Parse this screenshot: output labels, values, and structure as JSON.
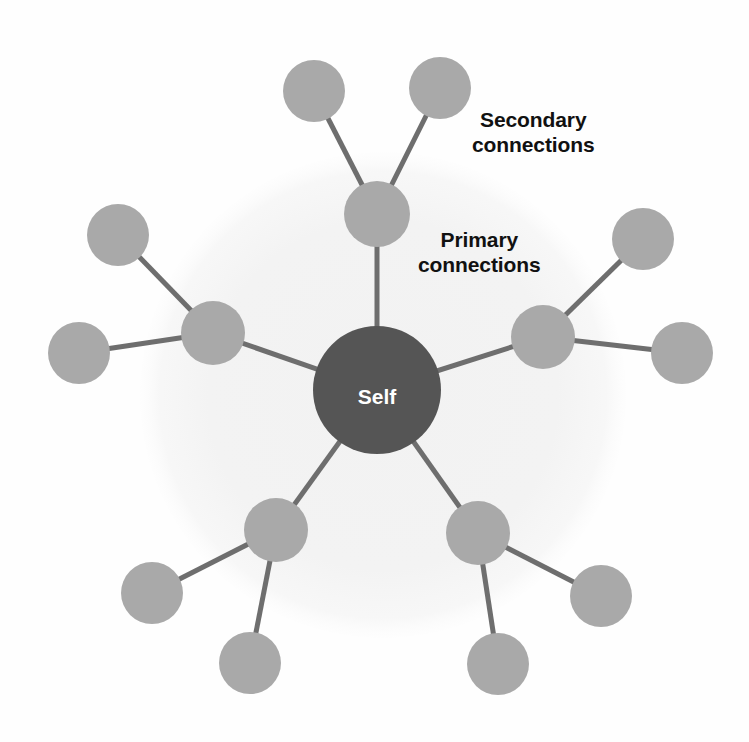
{
  "diagram": {
    "background_color": "#fefefe",
    "halo": {
      "name": "primary-connections-halo",
      "cx": 383,
      "cy": 395,
      "r": 243,
      "color": "#f4f4f4"
    },
    "colors": {
      "self_node": "#555555",
      "connection_node": "#a9a9a9",
      "edge": "#6e6e6e",
      "self_label": "#ffffff",
      "annotation_text": "#111111"
    },
    "center_node": {
      "id": "self",
      "label": "Self",
      "cx": 377,
      "cy": 390,
      "r": 64,
      "fill": "#555555"
    },
    "primary_nodes": [
      {
        "id": "primary-top",
        "cx": 377,
        "cy": 214,
        "r": 33
      },
      {
        "id": "primary-left",
        "cx": 213,
        "cy": 333,
        "r": 32
      },
      {
        "id": "primary-right",
        "cx": 543,
        "cy": 337,
        "r": 32
      },
      {
        "id": "primary-bottom-left",
        "cx": 276,
        "cy": 530,
        "r": 32
      },
      {
        "id": "primary-bottom-right",
        "cx": 478,
        "cy": 533,
        "r": 32
      }
    ],
    "secondary_nodes": [
      {
        "id": "secondary-top-left",
        "cx": 314,
        "cy": 91,
        "r": 31,
        "parent": "primary-top"
      },
      {
        "id": "secondary-top-right",
        "cx": 440,
        "cy": 88,
        "r": 31,
        "parent": "primary-top"
      },
      {
        "id": "secondary-left-upper",
        "cx": 118,
        "cy": 235,
        "r": 31,
        "parent": "primary-left"
      },
      {
        "id": "secondary-left-lower",
        "cx": 79,
        "cy": 353,
        "r": 31,
        "parent": "primary-left"
      },
      {
        "id": "secondary-right-upper",
        "cx": 643,
        "cy": 239,
        "r": 31,
        "parent": "primary-right"
      },
      {
        "id": "secondary-right-lower",
        "cx": 682,
        "cy": 353,
        "r": 31,
        "parent": "primary-right"
      },
      {
        "id": "secondary-bottom-left-outer",
        "cx": 152,
        "cy": 593,
        "r": 31,
        "parent": "primary-bottom-left"
      },
      {
        "id": "secondary-bottom-left-lower",
        "cx": 250,
        "cy": 663,
        "r": 31,
        "parent": "primary-bottom-left"
      },
      {
        "id": "secondary-bottom-right-outer",
        "cx": 601,
        "cy": 596,
        "r": 31,
        "parent": "primary-bottom-right"
      },
      {
        "id": "secondary-bottom-right-lower",
        "cx": 498,
        "cy": 664,
        "r": 31,
        "parent": "primary-bottom-right"
      }
    ],
    "edges": [
      {
        "id": "edge-self-primary-top",
        "x1": 377,
        "y1": 390,
        "x2": 377,
        "y2": 214,
        "width": 5
      },
      {
        "id": "edge-self-primary-left",
        "x1": 377,
        "y1": 390,
        "x2": 213,
        "y2": 333,
        "width": 5
      },
      {
        "id": "edge-self-primary-right",
        "x1": 377,
        "y1": 390,
        "x2": 543,
        "y2": 337,
        "width": 5
      },
      {
        "id": "edge-self-primary-bottom-left",
        "x1": 377,
        "y1": 390,
        "x2": 276,
        "y2": 530,
        "width": 5
      },
      {
        "id": "edge-self-primary-bottom-right",
        "x1": 377,
        "y1": 390,
        "x2": 478,
        "y2": 533,
        "width": 5
      },
      {
        "id": "edge-primary-top-secondary-left",
        "x1": 377,
        "y1": 214,
        "x2": 314,
        "y2": 91,
        "width": 5
      },
      {
        "id": "edge-primary-top-secondary-right",
        "x1": 377,
        "y1": 214,
        "x2": 440,
        "y2": 88,
        "width": 5
      },
      {
        "id": "edge-primary-left-secondary-upper",
        "x1": 213,
        "y1": 333,
        "x2": 118,
        "y2": 235,
        "width": 5
      },
      {
        "id": "edge-primary-left-secondary-lower",
        "x1": 213,
        "y1": 333,
        "x2": 79,
        "y2": 353,
        "width": 5
      },
      {
        "id": "edge-primary-right-secondary-upper",
        "x1": 543,
        "y1": 337,
        "x2": 643,
        "y2": 239,
        "width": 5
      },
      {
        "id": "edge-primary-right-secondary-lower",
        "x1": 543,
        "y1": 337,
        "x2": 682,
        "y2": 353,
        "width": 5
      },
      {
        "id": "edge-primary-bl-secondary-outer",
        "x1": 276,
        "y1": 530,
        "x2": 152,
        "y2": 593,
        "width": 5
      },
      {
        "id": "edge-primary-bl-secondary-lower",
        "x1": 276,
        "y1": 530,
        "x2": 250,
        "y2": 663,
        "width": 5
      },
      {
        "id": "edge-primary-br-secondary-outer",
        "x1": 478,
        "y1": 533,
        "x2": 601,
        "y2": 596,
        "width": 5
      },
      {
        "id": "edge-primary-br-secondary-lower",
        "x1": 478,
        "y1": 533,
        "x2": 498,
        "y2": 664,
        "width": 5
      }
    ],
    "annotations": {
      "secondary_label": "Secondary\nconnections",
      "primary_label": "Primary\nconnections"
    }
  }
}
